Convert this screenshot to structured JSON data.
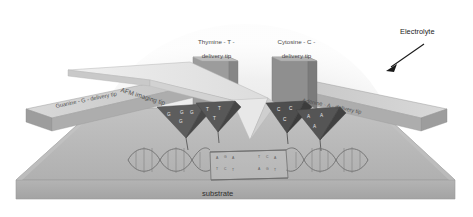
{
  "figure": {
    "title_visible": false,
    "background_color": "#ffffff"
  },
  "labels": {
    "electrolyte": "Electrolyte",
    "substrate": "substrate",
    "afm_imaging_tip": "AFM imaging tip",
    "thymine_tip_line1": "Thymine - T -",
    "thymine_tip_line2": "delivery tip",
    "cytosine_tip_line1": "Cytosine - C -",
    "cytosine_tip_line2": "delivery tip",
    "guanine_tip": "Guanine - G - delivery tip",
    "adenine_tip": "Adenine - A - delivery tip"
  },
  "tips": [
    {
      "id": "guanine",
      "base": "G",
      "label": "Guanine - G - delivery tip",
      "letters": [
        "G",
        "G",
        "G",
        "G"
      ],
      "shade": "#5d5d5d"
    },
    {
      "id": "thymine",
      "base": "T",
      "label": "Thymine - T - delivery tip",
      "letters": [
        "T",
        "T",
        "T"
      ],
      "shade": "#585858"
    },
    {
      "id": "cytosine",
      "base": "C",
      "label": "Cytosine - C - delivery tip",
      "letters": [
        "C",
        "C",
        "C"
      ],
      "shade": "#4e4e4e"
    },
    {
      "id": "adenine",
      "base": "A",
      "label": "Adenine - A - delivery tip",
      "letters": [
        "A",
        "A",
        "A"
      ],
      "shade": "#555555"
    }
  ],
  "dna": {
    "type": "double-helix",
    "bubble_bases_top": [
      "A",
      "G",
      "A",
      "T",
      "C",
      "A"
    ],
    "bubble_bases_bottom": [
      "T",
      "C",
      "T",
      "A",
      "G",
      "T"
    ]
  },
  "colors": {
    "substrate_top": "#b9b9b9",
    "substrate_front": "#a8a8a8",
    "substrate_edge": "#cfcfcf",
    "cantilever_light": "#e2e2e2",
    "cantilever_mid": "#c6c6c6",
    "cantilever_dark": "#8f8f8f",
    "electrolyte_dome": "#ededed",
    "text": "#3a3a3a",
    "arrow": "#1a1a1a"
  }
}
